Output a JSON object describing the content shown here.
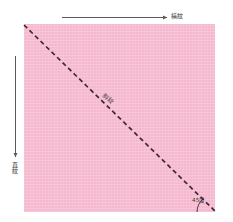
{
  "diagram": {
    "fabric": {
      "name": "fabric-square",
      "color": "#f6b8cf"
    },
    "bias_line": {
      "color": "#3d2838",
      "style": "dashed"
    },
    "labels": {
      "crosswise_grain": "橫紋",
      "lengthwise_grain": "直紋",
      "bias": "斜紋",
      "angle": "45度"
    },
    "arrows": {
      "crosswise_arrow_name": "crosswise-direction-arrow",
      "lengthwise_arrow_name": "lengthwise-direction-arrow",
      "arrow_color": "#5a5a5a"
    }
  }
}
